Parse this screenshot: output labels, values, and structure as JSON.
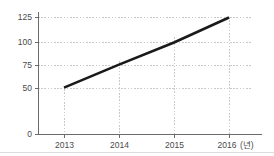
{
  "chart_data": {
    "type": "line",
    "title": "",
    "subtitle": "",
    "xlabel": "",
    "ylabel": "",
    "unit_label": "(년)",
    "categories": [
      "2013",
      "2014",
      "2015",
      "2016"
    ],
    "x": [
      2013,
      2014,
      2015,
      2016
    ],
    "values": [
      51,
      76,
      100,
      125
    ],
    "series": [
      {
        "name": "",
        "values": [
          51,
          76,
          100,
          125
        ]
      }
    ],
    "ylim": [
      0,
      125
    ],
    "y_ticks": [
      0,
      50,
      75,
      100,
      125
    ],
    "y_tick_labels": [
      "0",
      "50",
      "75",
      "100",
      "125"
    ],
    "x_tick_labels": [
      "2013",
      "2014",
      "2015",
      "2016"
    ],
    "grid": "dotted-both",
    "legend": "none",
    "line_color": "#1a1a1a",
    "grid_color": "#c9c9c9",
    "axis_color": "#6b6b6b",
    "text_color": "#4a4a4a",
    "background": "#ffffff"
  },
  "axes": {
    "y_labels": [
      {
        "text": "125",
        "value": 125
      },
      {
        "text": "100",
        "value": 100
      },
      {
        "text": "75",
        "value": 75
      },
      {
        "text": "50",
        "value": 50
      },
      {
        "text": "0",
        "value": 0
      }
    ],
    "x_labels": [
      {
        "text": "2013",
        "value": 2013
      },
      {
        "text": "2014",
        "value": 2014
      },
      {
        "text": "2015",
        "value": 2015
      },
      {
        "text": "2016",
        "value": 2016
      }
    ],
    "unit": "(년)"
  }
}
